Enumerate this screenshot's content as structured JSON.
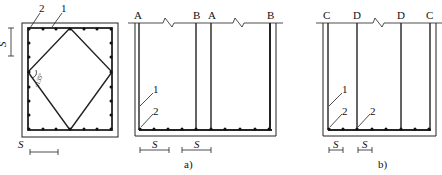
{
  "figure": {
    "left_panel": {
      "leader_labels": [
        "2",
        "1"
      ],
      "spacing_label_vertical": "S",
      "spacing_label_horizontal": "S",
      "angle_label": "≤135°"
    },
    "panel_a": {
      "top_labels": [
        "A",
        "B",
        "A",
        "B"
      ],
      "leader_labels": [
        "1",
        "2"
      ],
      "spacing_labels": [
        "S",
        "S"
      ],
      "caption": "a)"
    },
    "panel_b": {
      "top_labels": [
        "C",
        "D",
        "D",
        "C"
      ],
      "leader_labels": [
        "1",
        "2",
        "2"
      ],
      "spacing_labels": [
        "S",
        "S"
      ],
      "caption": "b)"
    },
    "colors": {
      "line": "#222222",
      "background": "#ffffff"
    }
  }
}
